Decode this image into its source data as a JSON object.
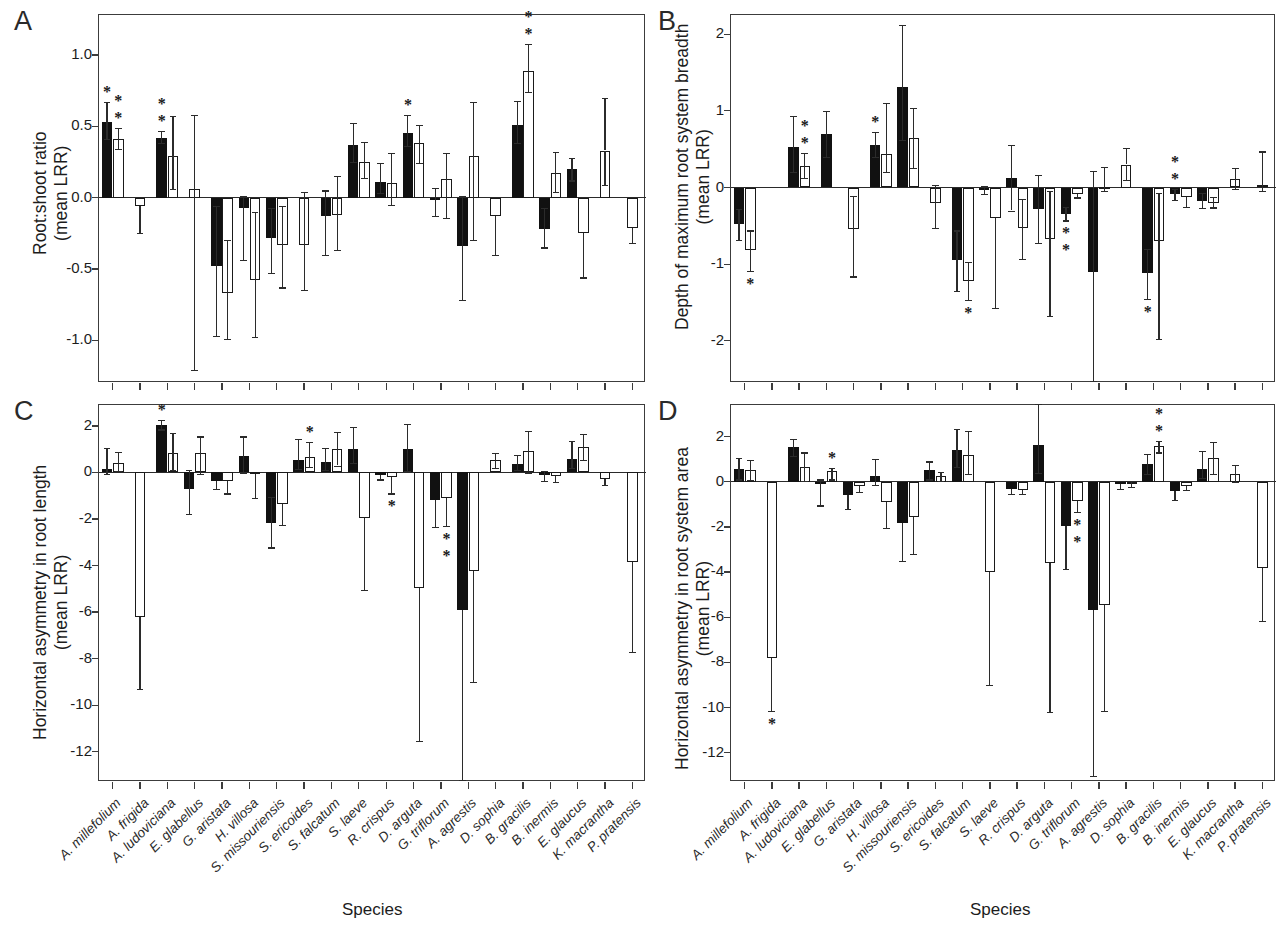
{
  "figure": {
    "x_axis_title": "Species",
    "species": [
      "A. millefolium",
      "A. frigida",
      "A. ludoviciana",
      "E. glabellus",
      "G. aristata",
      "H. villosa",
      "S. missouriensis",
      "S. ericoides",
      "S. falcatum",
      "S. laeve",
      "R. crispus",
      "D. arguta",
      "G. triflorum",
      "A. agrestis",
      "D. sophia",
      "B. gracilis",
      "B. inermis",
      "E. glaucus",
      "K. macrantha",
      "P. pratensis"
    ]
  },
  "panels": [
    {
      "letter": "A",
      "ylabel_line1": "Root:shoot ratio",
      "ylabel_line2": "(mean LRR)",
      "x_axis_title": "Species"
    },
    {
      "letter": "B",
      "ylabel_line1": "Depth of maximum root system breadth",
      "ylabel_line2": "(mean LRR)",
      "x_axis_title": "Species"
    },
    {
      "letter": "C",
      "ylabel_line1": "Horizontal asymmetry in root length",
      "ylabel_line2": "(mean LRR)",
      "x_axis_title": "Species"
    },
    {
      "letter": "D",
      "ylabel_line1": "Horizontal asymmetry in root system area",
      "ylabel_line2": "(mean LRR)",
      "x_axis_title": "Species"
    }
  ],
  "chart_data": [
    {
      "type": "bar",
      "panel": "A",
      "title": "Root:shoot ratio (mean LRR)",
      "xlabel": "Species",
      "ylabel": "Root:shoot ratio (mean LRR)",
      "ylim": [
        -1.3,
        1.28
      ],
      "yticks": [
        1.0,
        0.5,
        0.0,
        -0.5,
        -1.0
      ],
      "ytick_labels": [
        "1.0",
        "0.5",
        "0.0",
        "-0.5",
        "-1.0"
      ],
      "grid": false,
      "legend": "none",
      "categories": [
        "A. millefolium",
        "A. frigida",
        "A. ludoviciana",
        "E. glabellus",
        "G. aristata",
        "H. villosa",
        "S. missouriensis",
        "S. ericoides",
        "S. falcatum",
        "S. laeve",
        "R. crispus",
        "D. arguta",
        "G. triflorum",
        "A. agrestis",
        "D. sophia",
        "B. gracilis",
        "B. inermis",
        "E. glaucus",
        "K. macrantha",
        "P. pratensis"
      ],
      "series": [
        {
          "name": "filled",
          "values": [
            0.53,
            null,
            0.42,
            null,
            -0.48,
            -0.07,
            -0.28,
            null,
            -0.13,
            0.37,
            0.11,
            0.45,
            -0.02,
            -0.34,
            null,
            0.51,
            -0.22,
            0.2,
            null,
            null
          ],
          "err_lo": [
            0.41,
            null,
            0.38,
            null,
            -0.97,
            -0.44,
            -0.53,
            null,
            -0.4,
            0.25,
            0.03,
            0.36,
            -0.13,
            -0.72,
            null,
            0.38,
            -0.35,
            0.12,
            null,
            null
          ],
          "err_hi": [
            0.67,
            null,
            0.47,
            null,
            -0.06,
            0.01,
            -0.07,
            null,
            0.05,
            0.52,
            0.24,
            0.58,
            0.07,
            0.01,
            null,
            0.68,
            -0.07,
            0.28,
            null,
            null
          ]
        },
        {
          "name": "open",
          "values": [
            0.41,
            -0.06,
            0.29,
            0.06,
            -0.67,
            -0.58,
            -0.33,
            -0.33,
            -0.12,
            0.25,
            0.1,
            0.38,
            0.13,
            0.29,
            -0.13,
            0.89,
            0.17,
            -0.25,
            0.33,
            -0.21
          ],
          "err_lo": [
            0.34,
            -0.25,
            0.06,
            -1.21,
            -0.99,
            -0.98,
            -0.63,
            -0.65,
            -0.37,
            0.14,
            -0.05,
            0.24,
            -0.14,
            -0.3,
            -0.4,
            0.74,
            0.04,
            -0.56,
            0.09,
            -0.32
          ],
          "err_hi": [
            0.49,
            0.0,
            0.57,
            0.58,
            -0.3,
            -0.1,
            -0.06,
            0.04,
            0.15,
            0.39,
            0.31,
            0.51,
            0.31,
            0.67,
            0.0,
            1.08,
            0.32,
            0.0,
            0.7,
            0.0
          ]
        }
      ],
      "significance": [
        {
          "category": "A. millefolium",
          "series": "filled",
          "stars": 1
        },
        {
          "category": "A. millefolium",
          "series": "open",
          "stars": 2
        },
        {
          "category": "A. ludoviciana",
          "series": "filled",
          "stars": 2
        },
        {
          "category": "D. arguta",
          "series": "filled",
          "stars": 1
        },
        {
          "category": "B. gracilis",
          "series": "open",
          "stars": 2
        }
      ]
    },
    {
      "type": "bar",
      "panel": "B",
      "title": "Depth of maximum root system breadth (mean LRR)",
      "xlabel": "Species",
      "ylabel": "Depth of maximum root system breadth (mean LRR)",
      "ylim": [
        -2.55,
        2.25
      ],
      "yticks": [
        2,
        1,
        0,
        -1,
        -2
      ],
      "ytick_labels": [
        "2",
        "1",
        "0",
        "-1",
        "-2"
      ],
      "grid": false,
      "legend": "none",
      "categories": [
        "A. millefolium",
        "A. frigida",
        "A. ludoviciana",
        "E. glabellus",
        "G. aristata",
        "H. villosa",
        "S. missouriensis",
        "S. ericoides",
        "S. falcatum",
        "S. laeve",
        "R. crispus",
        "D. arguta",
        "G. triflorum",
        "A. agrestis",
        "D. sophia",
        "B. gracilis",
        "B. inermis",
        "E. glaucus",
        "K. macrantha",
        "P. pratensis"
      ],
      "series": [
        {
          "name": "filled",
          "values": [
            -0.48,
            null,
            0.53,
            0.7,
            null,
            0.55,
            1.31,
            null,
            -0.95,
            -0.03,
            0.13,
            -0.28,
            -0.34,
            -1.1,
            null,
            -1.12,
            -0.09,
            -0.17,
            null,
            null
          ],
          "err_lo": [
            -0.68,
            null,
            0.2,
            0.4,
            null,
            0.4,
            0.62,
            null,
            -1.35,
            -0.09,
            -0.3,
            -0.72,
            -0.43,
            -2.52,
            null,
            -1.45,
            -0.16,
            -0.27,
            null,
            null
          ],
          "err_hi": [
            -0.28,
            null,
            0.93,
            1.0,
            null,
            0.73,
            2.12,
            null,
            -0.56,
            0.02,
            0.55,
            0.16,
            -0.25,
            0.22,
            null,
            -0.8,
            -0.02,
            -0.07,
            null,
            null
          ]
        },
        {
          "name": "open",
          "values": [
            -0.82,
            null,
            0.28,
            null,
            -0.54,
            0.44,
            0.64,
            -0.2,
            -1.22,
            -0.4,
            -0.53,
            -0.67,
            -0.08,
            0.01,
            0.3,
            -0.7,
            -0.13,
            -0.2,
            0.11,
            0.03
          ],
          "err_lo": [
            -1.09,
            null,
            0.12,
            null,
            -1.16,
            0.2,
            0.26,
            -0.53,
            -1.47,
            -1.57,
            -0.93,
            -1.67,
            -0.13,
            -0.05,
            0.1,
            -1.98,
            -0.25,
            -0.26,
            -0.02,
            -0.04
          ],
          "err_hi": [
            -0.56,
            null,
            0.45,
            null,
            -0.11,
            1.1,
            1.04,
            0.03,
            -0.97,
            0.0,
            -0.15,
            -0.05,
            0.0,
            0.27,
            0.52,
            -0.07,
            0.0,
            -0.12,
            0.25,
            0.47
          ]
        }
      ],
      "significance": [
        {
          "category": "A. millefolium",
          "series": "open",
          "stars": 1,
          "below": true
        },
        {
          "category": "A. ludoviciana",
          "series": "open",
          "stars": 2
        },
        {
          "category": "H. villosa",
          "series": "filled",
          "stars": 1
        },
        {
          "category": "S. falcatum",
          "series": "open",
          "stars": 1,
          "below": true
        },
        {
          "category": "G. triflorum",
          "series": "filled",
          "stars": 2,
          "below": true
        },
        {
          "category": "B. gracilis",
          "series": "filled",
          "stars": 1,
          "below": true
        },
        {
          "category": "B. inermis",
          "series": "filled",
          "stars": 2
        }
      ]
    },
    {
      "type": "bar",
      "panel": "C",
      "title": "Horizontal asymmetry in root length (mean LRR)",
      "xlabel": "Species",
      "ylabel": "Horizontal asymmetry in root length (mean LRR)",
      "ylim": [
        -13.3,
        2.9
      ],
      "yticks": [
        2,
        0,
        -2,
        -4,
        -6,
        -8,
        -10,
        -12
      ],
      "ytick_labels": [
        "2",
        "0",
        "-2",
        "-4",
        "-6",
        "-8",
        "-10",
        "-12"
      ],
      "grid": false,
      "legend": "none",
      "categories": [
        "A. millefolium",
        "A. frigida",
        "A. ludoviciana",
        "E. glabellus",
        "G. aristata",
        "H. villosa",
        "S. missouriensis",
        "S. ericoides",
        "S. falcatum",
        "S. laeve",
        "R. crispus",
        "D. arguta",
        "G. triflorum",
        "A. agrestis",
        "D. sophia",
        "B. gracilis",
        "B. inermis",
        "E. glaucus",
        "K. macrantha",
        "P. pratensis"
      ],
      "series": [
        {
          "name": "filled",
          "values": [
            0.15,
            null,
            2.05,
            -0.72,
            -0.35,
            0.72,
            -2.15,
            0.52,
            0.45,
            1.03,
            -0.12,
            1.0,
            -1.18,
            -5.9,
            null,
            0.38,
            -0.1,
            0.6,
            null,
            null
          ],
          "err_lo": [
            -0.05,
            null,
            1.85,
            -1.8,
            -0.7,
            0.0,
            -3.22,
            0.15,
            0.1,
            0.4,
            -0.3,
            0.05,
            -2.35,
            -13.2,
            null,
            0.1,
            -0.35,
            0.2,
            null,
            null
          ],
          "err_hi": [
            1.05,
            null,
            2.25,
            0.1,
            0.0,
            1.55,
            -1.05,
            1.45,
            1.05,
            1.95,
            0.0,
            2.1,
            0.0,
            0.0,
            null,
            0.75,
            0.05,
            1.35,
            null,
            null
          ]
        },
        {
          "name": "open",
          "values": [
            0.42,
            -6.2,
            0.85,
            0.82,
            -0.38,
            -0.05,
            -1.35,
            0.65,
            1.0,
            -1.95,
            -0.18,
            -4.95,
            -1.1,
            -4.25,
            0.52,
            0.92,
            -0.15,
            1.08,
            -0.3,
            -3.85
          ],
          "err_lo": [
            0.05,
            -9.3,
            0.1,
            -0.05,
            -0.9,
            -1.1,
            -2.25,
            0.25,
            0.3,
            -5.05,
            -0.9,
            -11.55,
            -2.3,
            -9.0,
            0.2,
            0.0,
            -0.4,
            0.55,
            -0.55,
            -7.7
          ],
          "err_hi": [
            0.88,
            0.0,
            1.7,
            1.55,
            0.0,
            0.0,
            0.0,
            1.3,
            1.75,
            0.0,
            0.0,
            0.0,
            0.0,
            0.0,
            0.85,
            1.8,
            0.0,
            1.65,
            0.0,
            0.0
          ]
        }
      ],
      "significance": [
        {
          "category": "A. ludoviciana",
          "series": "filled",
          "stars": 1
        },
        {
          "category": "S. ericoides",
          "series": "open",
          "stars": 1
        },
        {
          "category": "R. crispus",
          "series": "open",
          "stars": 1,
          "below": true
        },
        {
          "category": "G. triflorum",
          "series": "open",
          "stars": 2,
          "below": true
        }
      ]
    },
    {
      "type": "bar",
      "panel": "D",
      "title": "Horizontal asymmetry in root system area (mean LRR)",
      "xlabel": "Species",
      "ylabel": "Horizontal asymmetry in root system area (mean LRR)",
      "ylim": [
        -13.3,
        3.4
      ],
      "yticks": [
        2,
        0,
        -2,
        -4,
        -6,
        -8,
        -10,
        -12
      ],
      "ytick_labels": [
        "2",
        "0",
        "-2",
        "-4",
        "-6",
        "-8",
        "-10",
        "-12"
      ],
      "grid": false,
      "legend": "none",
      "categories": [
        "A. millefolium",
        "A. frigida",
        "A. ludoviciana",
        "E. glabellus",
        "G. aristata",
        "H. villosa",
        "S. missouriensis",
        "S. ericoides",
        "S. falcatum",
        "S. laeve",
        "R. crispus",
        "D. arguta",
        "G. triflorum",
        "A. agrestis",
        "D. sophia",
        "B. gracilis",
        "B. inermis",
        "E. glaucus",
        "K. macrantha",
        "P. pratensis"
      ],
      "series": [
        {
          "name": "filled",
          "values": [
            0.58,
            null,
            1.52,
            -0.1,
            -0.58,
            0.25,
            -1.82,
            0.5,
            1.4,
            null,
            -0.32,
            1.65,
            -1.95,
            -5.7,
            -0.12,
            0.8,
            -0.4,
            0.55,
            null,
            null
          ],
          "err_lo": [
            0.1,
            null,
            1.15,
            -1.05,
            -1.2,
            -0.15,
            -3.5,
            0.1,
            0.65,
            null,
            -0.55,
            0.4,
            -3.85,
            -13.05,
            -0.3,
            0.35,
            -0.8,
            0.15,
            null,
            null
          ],
          "err_hi": [
            1.05,
            null,
            1.9,
            0.1,
            0.0,
            1.0,
            0.0,
            0.9,
            2.35,
            null,
            0.0,
            3.45,
            0.0,
            0.0,
            0.0,
            1.25,
            0.0,
            1.35,
            null,
            null
          ]
        },
        {
          "name": "open",
          "values": [
            0.5,
            -7.8,
            0.65,
            0.48,
            -0.18,
            -0.9,
            -1.58,
            0.25,
            1.2,
            -4.0,
            -0.35,
            -3.62,
            -0.85,
            -5.48,
            -0.08,
            1.58,
            -0.18,
            1.05,
            0.35,
            -3.8
          ],
          "err_lo": [
            0.08,
            -10.15,
            0.05,
            0.1,
            -0.45,
            -2.05,
            -3.2,
            0.05,
            0.35,
            -9.0,
            -0.55,
            -10.2,
            -1.35,
            -10.15,
            -0.25,
            1.3,
            -0.35,
            0.35,
            0.0,
            -6.15
          ],
          "err_hi": [
            0.95,
            0.0,
            1.3,
            0.6,
            0.0,
            0.0,
            0.0,
            0.45,
            2.25,
            0.0,
            0.0,
            0.0,
            0.0,
            0.0,
            0.05,
            1.8,
            0.0,
            1.75,
            0.75,
            0.0
          ]
        }
      ],
      "significance": [
        {
          "category": "A. frigida",
          "series": "open",
          "stars": 1,
          "below": true
        },
        {
          "category": "E. glabellus",
          "series": "open",
          "stars": 1
        },
        {
          "category": "G. triflorum",
          "series": "open",
          "stars": 2,
          "below": true
        },
        {
          "category": "B. gracilis",
          "series": "open",
          "stars": 2
        }
      ]
    }
  ]
}
